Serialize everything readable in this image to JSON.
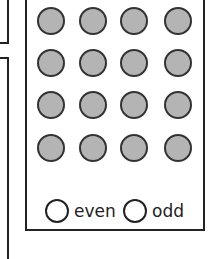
{
  "dots": {
    "rows": 4,
    "cols": 4,
    "count": 16,
    "fill_color": "#b4b4b4",
    "border_color": "#333333"
  },
  "options": [
    {
      "label": "even",
      "selected": false
    },
    {
      "label": "odd",
      "selected": false
    }
  ]
}
